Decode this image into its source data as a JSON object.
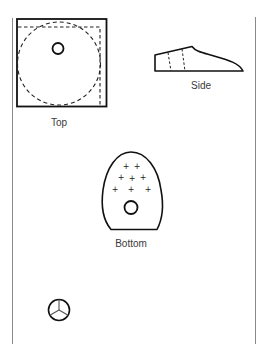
{
  "diagram": {
    "views": [
      {
        "id": "top",
        "label": "Top"
      },
      {
        "id": "side",
        "label": "Side"
      },
      {
        "id": "bottom",
        "label": "Bottom"
      }
    ],
    "unlabeled_figures": [
      {
        "id": "wheel",
        "description": "circle with three spokes"
      }
    ],
    "colors": {
      "stroke": "#111111",
      "border_line": "#888888",
      "label_text": "#3a3a3a",
      "spoke": "#555555"
    }
  }
}
